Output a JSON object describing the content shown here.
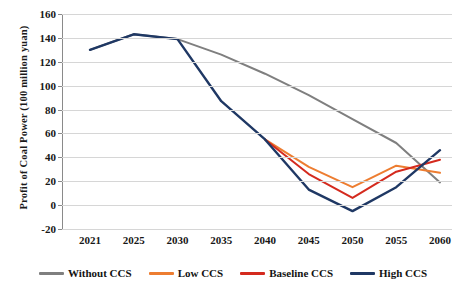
{
  "chart_data": {
    "type": "line",
    "title": "",
    "xlabel": "",
    "ylabel": "Profit of Coal Power (100 million yuan)",
    "categories": [
      "2021",
      "2025",
      "2030",
      "2035",
      "2040",
      "2045",
      "2050",
      "2055",
      "2060"
    ],
    "ylim": [
      -20,
      160
    ],
    "yticks": [
      160,
      140,
      120,
      100,
      80,
      60,
      40,
      20,
      0,
      -20
    ],
    "ytick_labels": [
      "160",
      "140",
      "120",
      "100",
      "80",
      "60",
      "40",
      "20",
      "0",
      "-20"
    ],
    "grid": true,
    "legend_position": "bottom",
    "series": [
      {
        "name": "Without CCS",
        "color": "#7f7f7f",
        "x": [
          "2021",
          "2025",
          "2030",
          "2035",
          "2040",
          "2045",
          "2050",
          "2055",
          "2060"
        ],
        "values": [
          130,
          143,
          139,
          126,
          110,
          92,
          72,
          52,
          19
        ]
      },
      {
        "name": "Low CCS",
        "color": "#ED7D31",
        "x": [
          "2040",
          "2045",
          "2050",
          "2055",
          "2060"
        ],
        "values": [
          55,
          32,
          15,
          33,
          27
        ]
      },
      {
        "name": "Baseline CCS",
        "color": "#D42A1E",
        "x": [
          "2040",
          "2045",
          "2050",
          "2055",
          "2060"
        ],
        "values": [
          55,
          26,
          6,
          28,
          38
        ]
      },
      {
        "name": "High CCS",
        "color": "#1F3864",
        "x": [
          "2021",
          "2025",
          "2030",
          "2035",
          "2040",
          "2045",
          "2050",
          "2055",
          "2060"
        ],
        "values": [
          130,
          143,
          139,
          87,
          55,
          13,
          -5,
          15,
          46
        ]
      }
    ]
  },
  "axis": {
    "y_title": "Profit of Coal Power (100 million yuan)"
  },
  "legend": {
    "items": [
      {
        "label": "Without CCS"
      },
      {
        "label": "Low CCS"
      },
      {
        "label": "Baseline CCS"
      },
      {
        "label": "High CCS"
      }
    ]
  }
}
